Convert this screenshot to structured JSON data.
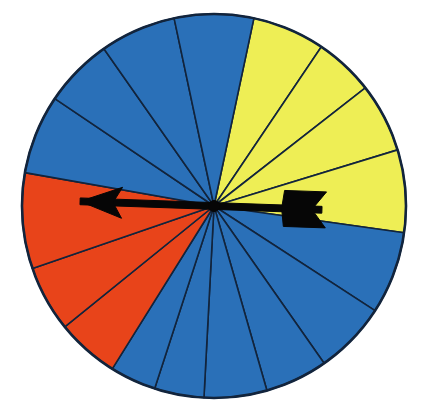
{
  "figure": {
    "name": "spinner-wheel",
    "title": "Spinner wheel with colored sectors and pointer arrow",
    "background_color": "#ffffff"
  },
  "wheel": {
    "center_x": 214,
    "center_y": 206,
    "radius": 192,
    "outline_color": "#12243c",
    "sector_count": 16,
    "colors": {
      "blue": "#2a70b8",
      "yellow": "#eeee55",
      "red": "#e8441a",
      "outline": "#12243c",
      "arrow": "#060606"
    },
    "sectors": [
      {
        "label": "sector-1",
        "color_name": "yellow",
        "color": "#eeee55",
        "start_deg": 78,
        "end_deg": 56
      },
      {
        "label": "sector-2",
        "color_name": "yellow",
        "color": "#eeee55",
        "start_deg": 56,
        "end_deg": 38
      },
      {
        "label": "sector-3",
        "color_name": "yellow",
        "color": "#eeee55",
        "start_deg": 38,
        "end_deg": 17
      },
      {
        "label": "sector-4",
        "color_name": "yellow",
        "color": "#eeee55",
        "start_deg": 17,
        "end_deg": -8
      },
      {
        "label": "sector-5",
        "color_name": "blue",
        "color": "#2a70b8",
        "start_deg": -8,
        "end_deg": -33
      },
      {
        "label": "sector-6",
        "color_name": "blue",
        "color": "#2a70b8",
        "start_deg": -33,
        "end_deg": -55
      },
      {
        "label": "sector-7",
        "color_name": "blue",
        "color": "#2a70b8",
        "start_deg": -55,
        "end_deg": -74
      },
      {
        "label": "sector-8",
        "color_name": "blue",
        "color": "#2a70b8",
        "start_deg": -74,
        "end_deg": -93
      },
      {
        "label": "sector-9",
        "color_name": "blue",
        "color": "#2a70b8",
        "start_deg": -93,
        "end_deg": -108
      },
      {
        "label": "sector-10",
        "color_name": "blue",
        "color": "#2a70b8",
        "start_deg": -108,
        "end_deg": -122
      },
      {
        "label": "sector-11",
        "color_name": "red",
        "color": "#e8441a",
        "start_deg": -122,
        "end_deg": -141
      },
      {
        "label": "sector-12",
        "color_name": "red",
        "color": "#e8441a",
        "start_deg": -141,
        "end_deg": -161
      },
      {
        "label": "sector-13",
        "color_name": "red",
        "color": "#e8441a",
        "start_deg": -161,
        "end_deg": -190
      },
      {
        "label": "sector-14",
        "color_name": "blue",
        "color": "#2a70b8",
        "start_deg": 170,
        "end_deg": 146
      },
      {
        "label": "sector-15",
        "color_name": "blue",
        "color": "#2a70b8",
        "start_deg": 146,
        "end_deg": 125
      },
      {
        "label": "sector-16",
        "color_name": "blue",
        "color": "#2a70b8",
        "start_deg": 125,
        "end_deg": 102
      },
      {
        "label": "sector-17",
        "color_name": "blue",
        "color": "#2a70b8",
        "start_deg": 102,
        "end_deg": 78
      }
    ]
  },
  "pointer": {
    "name": "spinner-arrow",
    "direction_deg": 178,
    "head_tip_x": 80,
    "head_tip_y": 209,
    "tail_end_x": 325,
    "tail_end_y": 202,
    "color": "#060606"
  },
  "chart_data": {
    "type": "pie",
    "title": "Spinner wheel",
    "xlabel": "",
    "ylabel": "",
    "legend_position": "none",
    "grid": false,
    "categories": [
      "yellow-1",
      "yellow-2",
      "yellow-3",
      "yellow-4",
      "blue-1",
      "blue-2",
      "blue-3",
      "blue-4",
      "blue-5",
      "blue-6",
      "red-1",
      "red-2",
      "red-3",
      "blue-7",
      "blue-8",
      "blue-9",
      "blue-10"
    ],
    "values": [
      22,
      18,
      21,
      25,
      25,
      22,
      19,
      19,
      15,
      14,
      19,
      20,
      29,
      24,
      21,
      23,
      24
    ],
    "value_unit": "degrees",
    "colors": [
      "#eeee55",
      "#eeee55",
      "#eeee55",
      "#eeee55",
      "#2a70b8",
      "#2a70b8",
      "#2a70b8",
      "#2a70b8",
      "#2a70b8",
      "#2a70b8",
      "#e8441a",
      "#e8441a",
      "#e8441a",
      "#2a70b8",
      "#2a70b8",
      "#2a70b8",
      "#2a70b8"
    ],
    "color_group_totals": {
      "blue": 206,
      "yellow": 86,
      "red": 68
    },
    "annotations": [
      "double-ended pointer arrow across center, head aimed left into red region"
    ]
  }
}
